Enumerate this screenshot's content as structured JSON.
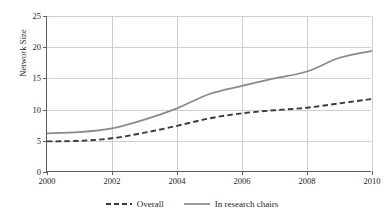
{
  "chart_data": {
    "type": "line",
    "title": "",
    "xlabel": "",
    "ylabel": "Network Size",
    "xlim": [
      2000,
      2010
    ],
    "ylim": [
      0,
      25
    ],
    "grid": true,
    "legend_position": "bottom-center",
    "x_ticks": [
      "2000",
      "2002",
      "2004",
      "2006",
      "2008",
      "2010"
    ],
    "y_ticks": [
      "0",
      "5",
      "10",
      "15",
      "20",
      "25"
    ],
    "x": [
      2000,
      2001,
      2002,
      2003,
      2004,
      2005,
      2006,
      2007,
      2008,
      2009,
      2010
    ],
    "series": [
      {
        "name": "Overall",
        "style": "dashed",
        "color": "#3a3a3a",
        "values": [
          4.9,
          5.0,
          5.4,
          6.3,
          7.4,
          8.6,
          9.4,
          9.9,
          10.3,
          11.0,
          11.7
        ]
      },
      {
        "name": "In research chairs",
        "style": "solid",
        "color": "#8a8a8a",
        "values": [
          6.2,
          6.4,
          7.0,
          8.4,
          10.2,
          12.5,
          13.8,
          15.0,
          16.1,
          18.3,
          19.4
        ]
      }
    ]
  },
  "legend": {
    "items": [
      {
        "label": "Overall"
      },
      {
        "label": "In research chairs"
      }
    ]
  },
  "colors": {
    "axis": "#5f5f5f",
    "grid": "#cfcfcf",
    "overall": "#3a3a3a",
    "research_chairs": "#8a8a8a",
    "background": "#ffffff"
  }
}
